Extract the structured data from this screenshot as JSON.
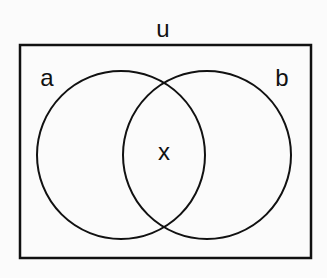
{
  "diagram": {
    "type": "venn",
    "universe_label": "u",
    "sets": [
      {
        "label": "a"
      },
      {
        "label": "b"
      }
    ],
    "intersection_label": "x",
    "colors": {
      "stroke": "#111111",
      "background": "#fbfbfb"
    }
  }
}
